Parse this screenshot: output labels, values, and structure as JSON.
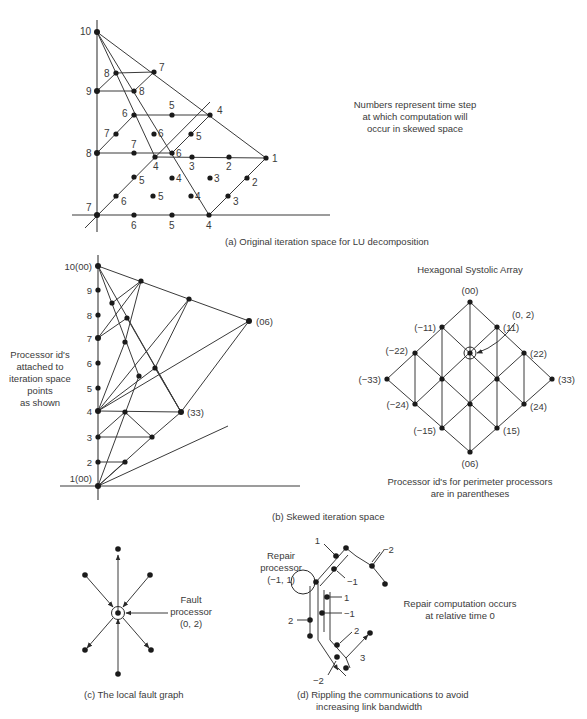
{
  "panel_a": {
    "caption": "(a)  Original iteration space for LU decomposition",
    "note": [
      "Numbers represent time step",
      "at which computation will",
      "occur in skewed space"
    ],
    "axis_labels": {
      "y10": "10",
      "y9": "9",
      "y8": "8",
      "y7": "7"
    },
    "point_labels": {
      "p_8a": "8",
      "p_7a": "7",
      "p_8b": "8",
      "p_6a": "6",
      "p_5a": "5",
      "p_4a": "4",
      "p_7b": "7",
      "p_6b": "6",
      "p_5b": "5",
      "p_7c": "7",
      "p_6c": "6",
      "p_4b": "4",
      "p_3a": "3",
      "p_2a": "2",
      "p_1": "1",
      "p_5c": "5",
      "p_4c": "4",
      "p_3b": "3",
      "p_2b": "2",
      "p_6d": "6",
      "p_5d": "5",
      "p_4d": "4",
      "p_3c": "3",
      "p_6e": "6",
      "p_5e": "5",
      "p_4e": "4"
    }
  },
  "panel_b": {
    "caption": "(b)  Skewed iteration space",
    "side_note": [
      "Processor id's",
      "attached to",
      "iteration space",
      "points",
      "as shown"
    ],
    "axis_labels": [
      "10(00)",
      "9",
      "8",
      "7",
      "6",
      "5",
      "4",
      "3",
      "2",
      "1(00)"
    ],
    "label_06": "(06)",
    "label_33": "(33)"
  },
  "hex_array": {
    "title": "Hexagonal Systolic Array",
    "labels": {
      "n00": "(00)",
      "n_m11": "(−11)",
      "n11": "(11)",
      "n_m22": "(−22)",
      "n22": "(22)",
      "n_m33": "(−33)",
      "n33": "(33)",
      "n_m24": "(−24)",
      "n24": "(24)",
      "n_m15": "(−15)",
      "n15": "(15)",
      "n06": "(06)",
      "fault": "(0, 2)"
    },
    "note": [
      "Processor id's for perimeter processors",
      "are in parentheses"
    ]
  },
  "panel_c": {
    "caption": "(c)  The local fault graph",
    "fault_label": [
      "Fault",
      "processor",
      "(0, 2)"
    ]
  },
  "panel_d": {
    "caption": [
      "(d)  Rippling the communications to avoid",
      "increasing link bandwidth"
    ],
    "repair_label": [
      "Repair",
      "processor",
      "(−1, 1)"
    ],
    "tags": {
      "t1a": "1",
      "t_m2a": "−2",
      "t_m1a": "−1",
      "t1b": "1",
      "t_m1b": "−1",
      "t2a": "2",
      "t2b": "2",
      "t3": "3",
      "t_m2b": "−2"
    },
    "note": [
      "Repair computation occurs",
      "at relative time 0"
    ]
  }
}
